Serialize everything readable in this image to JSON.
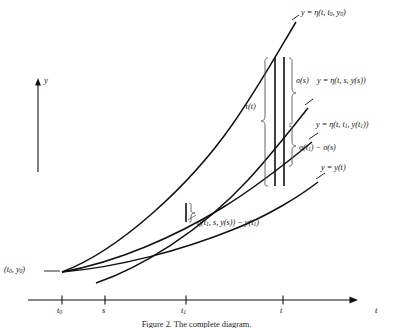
{
  "figure": {
    "caption": "Figure 2.  The complete diagram.",
    "axes": {
      "y_axis_label": "y",
      "x_axis_label": "t",
      "ticks": [
        {
          "label": "t",
          "sub": "0",
          "x": 62
        },
        {
          "label": "s",
          "sub": "",
          "x": 105
        },
        {
          "label": "t",
          "sub": "1",
          "x": 186
        },
        {
          "label": "t",
          "sub": "",
          "x": 283
        }
      ]
    },
    "origin_point": {
      "label": "(t",
      "sub": "0",
      "label2": ", y",
      "sub2": "0",
      "label3": ")",
      "full": "(t0, y0)"
    },
    "curve_labels": [
      {
        "name": "eta-t0-y0",
        "text_a": "y = η(t, t",
        "sub_a": "0",
        "text_b": ", y",
        "sub_b": "0",
        "text_c": ")"
      },
      {
        "name": "eta-s-ys",
        "text_a": "y = η(t, s, y(s))"
      },
      {
        "name": "eta-t1-yt1",
        "text_a": "y = η(t, t",
        "sub_a": "1",
        "text_b": ", y(t",
        "sub_b": "1",
        "text_c": "))"
      },
      {
        "name": "y-of-t",
        "text_a": "y = y(t)"
      }
    ],
    "annotations": {
      "tau": "τ(t)",
      "sigma_s": "σ(s)",
      "sigma_diff_a": "σ(t",
      "sigma_diff_sub": "1",
      "sigma_diff_b": ") − σ(s)",
      "eta_minus_y_a": "η(t",
      "eta_minus_y_sub1": "1",
      "eta_minus_y_b": ", s, y(s)) − y(t",
      "eta_minus_y_sub2": "1",
      "eta_minus_y_c": ")"
    },
    "colors": {
      "ink": "#111111",
      "background": "#ffffff"
    }
  }
}
